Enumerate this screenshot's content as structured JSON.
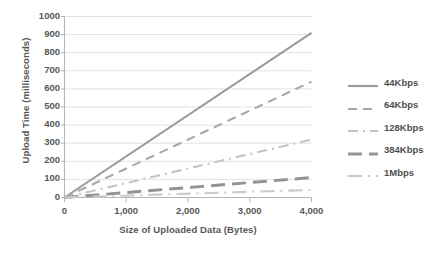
{
  "chart_data": {
    "type": "line",
    "title": "",
    "xlabel": "Size of Uploaded Data (Bytes)",
    "ylabel": "Upload Time (milliseconds)",
    "xlim": [
      0,
      4000
    ],
    "ylim": [
      0,
      1000
    ],
    "xticks": [
      "0",
      "1,000",
      "2,000",
      "3,000",
      "4,000"
    ],
    "xtick_values": [
      0,
      1000,
      2000,
      3000,
      4000
    ],
    "yticks": [
      "0",
      "100",
      "200",
      "300",
      "400",
      "500",
      "600",
      "700",
      "800",
      "900",
      "1000"
    ],
    "ytick_values": [
      0,
      100,
      200,
      300,
      400,
      500,
      600,
      700,
      800,
      900,
      1000
    ],
    "grid": "horizontal",
    "legend_position": "right",
    "x": [
      0,
      4000
    ],
    "series": [
      {
        "name": "44Kbps",
        "values": [
          0,
          910
        ],
        "style": "solid",
        "color": "#9b9b9b",
        "width": 2.1,
        "dash": ""
      },
      {
        "name": "64Kbps",
        "values": [
          0,
          640
        ],
        "style": "dashed",
        "color": "#a8a8a8",
        "width": 2.1,
        "dash": "9,6"
      },
      {
        "name": "128Kbps",
        "values": [
          0,
          320
        ],
        "style": "dash-dot",
        "color": "#c4c4c4",
        "width": 2.1,
        "dash": "10,5,2,5"
      },
      {
        "name": "384Kbps",
        "values": [
          0,
          110
        ],
        "style": "long-dash",
        "color": "#949494",
        "width": 3.0,
        "dash": "14,7"
      },
      {
        "name": "1Mbps",
        "values": [
          0,
          42
        ],
        "style": "long-dash-dot",
        "color": "#c9c9c9",
        "width": 2.1,
        "dash": "14,6,2,6"
      }
    ],
    "colors": {
      "grid": "#e2e2e2",
      "axis": "#b5b5b5",
      "text": "#575757",
      "background": "#ffffff"
    }
  }
}
